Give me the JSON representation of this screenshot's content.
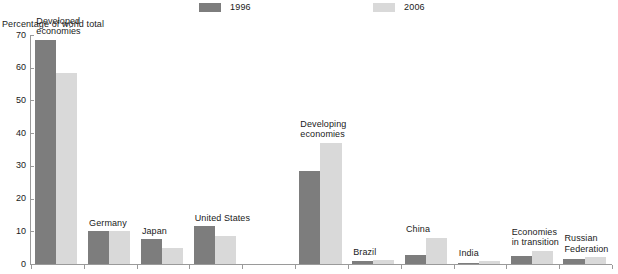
{
  "chart_data": {
    "type": "bar",
    "title": "",
    "subtitle": "",
    "xlabel": "",
    "ylabel": "Percentage of world total",
    "ylim": [
      0,
      70
    ],
    "yticks": [
      0,
      10,
      20,
      30,
      40,
      50,
      60,
      70
    ],
    "grid": false,
    "legend_position": "top-center",
    "categories": [
      "Developed economies",
      "Germany",
      "Japan",
      "United States",
      "Developing economies",
      "Brazil",
      "China",
      "India",
      "Economies in transition",
      "Russian Federation"
    ],
    "series": [
      {
        "name": "1996",
        "color": "#7d7d7d",
        "values": [
          68.5,
          10.0,
          7.5,
          11.5,
          28.5,
          0.8,
          2.8,
          0.3,
          2.5,
          1.5
        ]
      },
      {
        "name": "2006",
        "color": "#d9d9d9",
        "values": [
          58.5,
          10.0,
          5.0,
          8.5,
          37.0,
          1.2,
          8.0,
          0.8,
          4.0,
          2.0
        ]
      }
    ]
  },
  "legend": {
    "items": [
      {
        "label": "1996",
        "color": "#7d7d7d"
      },
      {
        "label": "2006",
        "color": "#d9d9d9"
      }
    ]
  },
  "axis": {
    "y_title": "Percentage of world total",
    "y_tick_labels": [
      "70",
      "60",
      "50",
      "40",
      "30",
      "20",
      "10",
      "0"
    ]
  },
  "group_labels": [
    "Developed\neconomies",
    "Germany",
    "Japan",
    "United States",
    "Developing\neconomies",
    "Brazil",
    "China",
    "India",
    "Economies\nin transition",
    "Russian\nFederation"
  ]
}
